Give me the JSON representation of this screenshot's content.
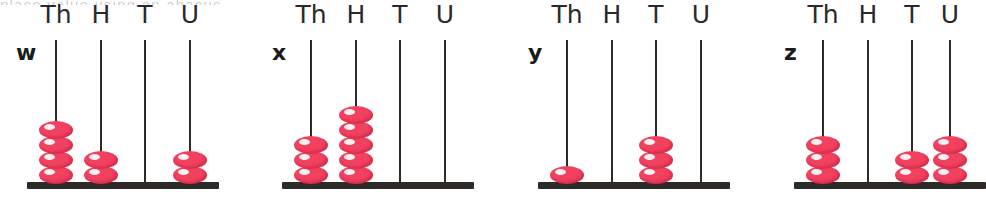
{
  "page": {
    "background_color": "#ffffff",
    "bead_color": "#f2405f",
    "rod_color": "#2b2b2b",
    "base_color": "#2e2a28",
    "text_color": "#1b1b1b",
    "top_cut_off_text": "place value using an abacus"
  },
  "column_headers": [
    "Th",
    "H",
    "T",
    "U"
  ],
  "chart_data": {
    "type": "bar",
    "title": "",
    "xlabel": "",
    "ylabel": "",
    "categories": [
      "Th",
      "H",
      "T",
      "U"
    ],
    "series": [
      {
        "name": "w",
        "values": [
          4,
          2,
          0,
          2
        ]
      },
      {
        "name": "x",
        "values": [
          3,
          5,
          0,
          0
        ]
      },
      {
        "name": "y",
        "values": [
          1,
          0,
          3,
          0
        ]
      },
      {
        "name": "z",
        "values": [
          3,
          0,
          2,
          3
        ]
      }
    ],
    "ylim": [
      0,
      5
    ],
    "grid": false,
    "legend": "none"
  },
  "abacuses": [
    {
      "label": "w",
      "label_x": 16,
      "label_y": 42,
      "base_left": 27,
      "base_width": 192,
      "columns": [
        {
          "name": "Th",
          "x": 56,
          "beads": 4
        },
        {
          "name": "H",
          "x": 101,
          "beads": 2
        },
        {
          "name": "T",
          "x": 145,
          "beads": 0
        },
        {
          "name": "U",
          "x": 190,
          "beads": 2
        }
      ]
    },
    {
      "label": "x",
      "label_x": 272,
      "label_y": 42,
      "base_left": 282,
      "base_width": 192,
      "columns": [
        {
          "name": "Th",
          "x": 311,
          "beads": 3
        },
        {
          "name": "H",
          "x": 356,
          "beads": 5
        },
        {
          "name": "T",
          "x": 400,
          "beads": 0
        },
        {
          "name": "U",
          "x": 445,
          "beads": 0
        }
      ]
    },
    {
      "label": "y",
      "label_x": 528,
      "label_y": 42,
      "base_left": 538,
      "base_width": 192,
      "columns": [
        {
          "name": "Th",
          "x": 567,
          "beads": 1
        },
        {
          "name": "H",
          "x": 612,
          "beads": 0
        },
        {
          "name": "T",
          "x": 656,
          "beads": 3
        },
        {
          "name": "U",
          "x": 701,
          "beads": 0
        }
      ]
    },
    {
      "label": "z",
      "label_x": 784,
      "label_y": 42,
      "base_left": 794,
      "base_width": 192,
      "columns": [
        {
          "name": "Th",
          "x": 823,
          "beads": 3
        },
        {
          "name": "H",
          "x": 868,
          "beads": 0
        },
        {
          "name": "T",
          "x": 912,
          "beads": 2
        },
        {
          "name": "U",
          "x": 950,
          "beads": 3
        }
      ]
    }
  ]
}
